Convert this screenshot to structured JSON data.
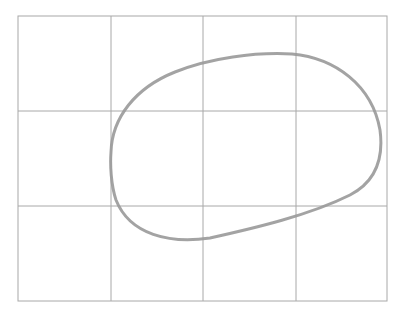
{
  "diagram": {
    "grid": {
      "columns": 4,
      "rows": 3,
      "left": 18,
      "top": 16,
      "right": 387,
      "bottom": 301,
      "vertical_lines": [
        111,
        203,
        296
      ],
      "horizontal_lines": [
        111,
        206
      ],
      "line_color": "#a8a8a8"
    },
    "shape": {
      "type": "oval",
      "stroke_color": "#9a9a9a",
      "leftmost": [
        111,
        152
      ],
      "topmost": [
        285,
        54
      ],
      "rightmost": [
        380,
        150
      ],
      "bottommost": [
        200,
        241
      ]
    }
  }
}
